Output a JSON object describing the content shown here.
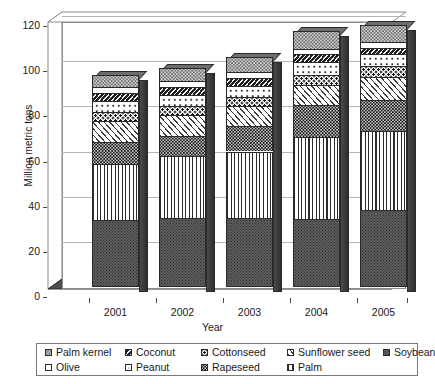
{
  "chart_data": {
    "type": "bar",
    "subtype": "stacked-bar-3d",
    "title": "",
    "xlabel": "Year",
    "ylabel": "Million metric tons",
    "categories": [
      "2001",
      "2002",
      "2003",
      "2004",
      "2005"
    ],
    "ylim": [
      0,
      120
    ],
    "yticks": [
      0,
      20,
      40,
      60,
      80,
      100,
      120
    ],
    "grid": true,
    "legend_position": "bottom",
    "stack_order_bottom_to_top": [
      "Soybean",
      "Palm",
      "Rapeseed",
      "Sunflower seed",
      "Cottonseed",
      "Peanut",
      "Coconut",
      "Olive",
      "Palm kernel"
    ],
    "series": [
      {
        "name": "Soybean",
        "values": [
          29.5,
          30.5,
          30.5,
          30.0,
          34.0
        ]
      },
      {
        "name": "Palm",
        "values": [
          25.0,
          27.5,
          29.5,
          36.5,
          35.0
        ]
      },
      {
        "name": "Rapeseed",
        "values": [
          9.5,
          9.0,
          11.5,
          14.0,
          14.0
        ]
      },
      {
        "name": "Sunflower seed",
        "values": [
          9.5,
          9.0,
          8.5,
          9.0,
          10.0
        ]
      },
      {
        "name": "Cottonseed",
        "values": [
          4.0,
          4.0,
          4.0,
          4.5,
          5.0
        ]
      },
      {
        "name": "Peanut",
        "values": [
          5.0,
          5.0,
          5.0,
          5.5,
          5.0
        ]
      },
      {
        "name": "Coconut",
        "values": [
          3.5,
          3.5,
          3.5,
          3.5,
          3.0
        ]
      },
      {
        "name": "Olive",
        "values": [
          2.5,
          2.5,
          2.5,
          2.5,
          2.5
        ]
      },
      {
        "name": "Palm kernel",
        "values": [
          5.5,
          6.0,
          7.0,
          8.0,
          7.5
        ]
      }
    ],
    "totals": [
      94.0,
      97.0,
      102.0,
      113.5,
      116.0
    ],
    "colors": {
      "Soybean": "#5e5e5e",
      "Palm": "#ffffff",
      "Rapeseed": "#111111",
      "Sunflower seed": "#ffffff",
      "Cottonseed": "#ffffff",
      "Peanut": "#ffffff",
      "Coconut": "#1d1d1d",
      "Olive": "#ffffff",
      "Palm kernel": "#cfcfcf"
    }
  },
  "axes": {
    "y_label": "Million metric tons",
    "x_label": "Year",
    "y_ticks": [
      "0",
      "20",
      "40",
      "60",
      "80",
      "100",
      "120"
    ],
    "x_ticks": [
      "2001",
      "2002",
      "2003",
      "2004",
      "2005"
    ]
  },
  "legend": {
    "rows": [
      [
        {
          "label": "Palm kernel",
          "pattern": "palmkernel"
        },
        {
          "label": "Coconut",
          "pattern": "coconut"
        },
        {
          "label": "Cottonseed",
          "pattern": "cottonseed"
        },
        {
          "label": "Sunflower seed",
          "pattern": "sunflower"
        },
        {
          "label": "Soybean",
          "pattern": "soybean"
        }
      ],
      [
        {
          "label": "Olive",
          "pattern": "olive"
        },
        {
          "label": "Peanut",
          "pattern": "peanut"
        },
        {
          "label": "Rapeseed",
          "pattern": "rapeseed"
        },
        {
          "label": "Palm",
          "pattern": "palm"
        }
      ]
    ]
  }
}
